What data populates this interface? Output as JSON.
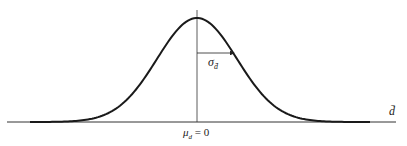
{
  "diagram": {
    "type": "normal-distribution-curve",
    "mean_label": "μ",
    "mean_sub": "d",
    "mean_value": "= 0",
    "sigma_label": "σ",
    "sigma_sub": "d̄",
    "axis_label": "d̄",
    "colors": {
      "curve": "#1a1a1a",
      "axis": "#333333"
    }
  }
}
